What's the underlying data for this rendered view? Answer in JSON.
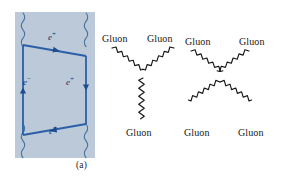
{
  "figure": {
    "panels": [
      {
        "id": "a",
        "caption": "(a)",
        "kind": "feynman-box-loop",
        "background_color": "#bcc9d8",
        "line_color": "#2a5fa8",
        "labels": [
          {
            "id": "e-top",
            "text": "e",
            "charge": "+",
            "position": "top"
          },
          {
            "id": "e-left",
            "text": "e",
            "charge": "−",
            "position": "left"
          },
          {
            "id": "e-right",
            "text": "e",
            "charge": "+",
            "position": "right"
          },
          {
            "id": "e-bottom",
            "text": "e",
            "charge": "+",
            "position": "bottom"
          }
        ],
        "wavy_lines": 4,
        "wavy_line_meaning": "photon"
      },
      {
        "id": "b",
        "caption": "(b)",
        "kind": "gluon-vertices",
        "background_color": "#ffffff",
        "line_color": "#161616",
        "vertices": [
          {
            "id": "three-gluon",
            "legs": 3,
            "labels": [
              "Gluon",
              "Gluon",
              "Gluon"
            ]
          },
          {
            "id": "four-gluon",
            "legs": 4,
            "labels": [
              "Gluon",
              "Gluon",
              "Gluon",
              "Gluon"
            ]
          }
        ]
      }
    ]
  },
  "panel_a": {
    "caption": "(a)",
    "label_e_top": "e",
    "label_e_top_charge": "+",
    "label_e_left": "e",
    "label_e_left_charge": "−",
    "label_e_right": "e",
    "label_e_right_charge": "+",
    "label_e_bottom": "e",
    "label_e_bottom_charge": "+"
  },
  "panel_b": {
    "caption": "(b)",
    "v3_left": "Gluon",
    "v3_right": "Gluon",
    "v3_bottom": "Gluon",
    "v4_top_left": "Gluon",
    "v4_top_right": "Gluon",
    "v4_bottom_left": "Gluon",
    "v4_bottom_right": "Gluon"
  },
  "colors": {
    "panel_a_background": "#bcc9d8",
    "fermion_line": "#2a5fa8",
    "photon_line": "#4a7ab5",
    "gluon_line": "#161616",
    "caption_text": "#1d1d1d",
    "particle_label": "#12305e",
    "page_background": "#ffffff"
  }
}
